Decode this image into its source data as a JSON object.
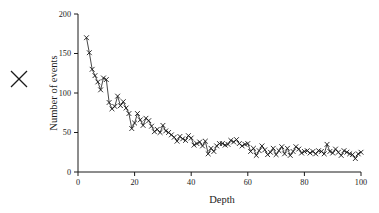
{
  "figure": {
    "background_color": "#ffffff",
    "ink_color": "#1a1a1a",
    "stray_mark": {
      "name": "x-mark",
      "glyph": "X",
      "x": 19,
      "y": 79
    }
  },
  "chart_data": {
    "type": "line",
    "title": "",
    "subtitle": "",
    "xlabel": "Depth",
    "ylabel": "Number of events",
    "xlim": [
      0,
      100
    ],
    "ylim": [
      0,
      200
    ],
    "xticks": [
      0,
      20,
      40,
      60,
      80,
      100
    ],
    "yticks": [
      0,
      50,
      100,
      150,
      200
    ],
    "xtick_labels": [
      "0",
      "20",
      "40",
      "60",
      "80",
      "100"
    ],
    "ytick_labels": [
      "0",
      "50",
      "100",
      "150",
      "200"
    ],
    "grid": false,
    "legend": null,
    "legend_position": "none",
    "spines": [
      "left",
      "bottom"
    ],
    "tick_direction": "out",
    "marker": "x",
    "marker_size": 2.4,
    "line_color": "#1a1a1a",
    "line_width": 0.8,
    "annotations": [],
    "series": [
      {
        "name": "events",
        "x": [
          3,
          4,
          5,
          6,
          7,
          8,
          9,
          10,
          11,
          12,
          13,
          14,
          15,
          16,
          17,
          18,
          19,
          20,
          21,
          22,
          23,
          24,
          25,
          26,
          27,
          28,
          29,
          30,
          31,
          32,
          33,
          34,
          35,
          36,
          37,
          38,
          39,
          40,
          41,
          42,
          43,
          44,
          45,
          46,
          47,
          48,
          49,
          50,
          51,
          52,
          53,
          54,
          55,
          56,
          57,
          58,
          59,
          60,
          61,
          62,
          63,
          64,
          65,
          66,
          67,
          68,
          69,
          70,
          71,
          72,
          73,
          74,
          75,
          76,
          77,
          78,
          79,
          80,
          81,
          82,
          83,
          84,
          85,
          86,
          87,
          88,
          89,
          90,
          91,
          92,
          93,
          94,
          95,
          96,
          97,
          98,
          99,
          100
        ],
        "values": [
          170,
          151,
          130,
          122,
          114,
          104,
          119,
          117,
          88,
          80,
          83,
          96,
          84,
          89,
          81,
          74,
          55,
          62,
          74,
          66,
          59,
          68,
          65,
          58,
          51,
          54,
          50,
          59,
          52,
          50,
          47,
          44,
          39,
          45,
          42,
          40,
          46,
          43,
          34,
          36,
          38,
          33,
          39,
          23,
          30,
          26,
          33,
          36,
          36,
          34,
          35,
          40,
          38,
          41,
          36,
          33,
          35,
          36,
          26,
          30,
          21,
          27,
          33,
          28,
          22,
          25,
          30,
          22,
          27,
          32,
          23,
          30,
          21,
          26,
          32,
          29,
          24,
          26,
          27,
          24,
          26,
          23,
          27,
          26,
          23,
          35,
          26,
          24,
          29,
          25,
          21,
          27,
          25,
          23,
          22,
          17,
          23,
          25
        ]
      }
    ]
  }
}
